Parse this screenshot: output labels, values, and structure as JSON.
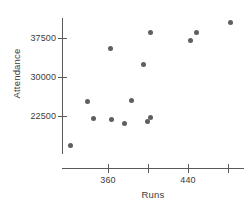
{
  "chart_data": {
    "type": "scatter",
    "title": "",
    "xlabel": "Runs",
    "ylabel": "Attendance",
    "xlim": [
      330,
      490
    ],
    "ylim": [
      16000,
      42000
    ],
    "grid": false,
    "legend": null,
    "x_ticks": [
      {
        "value": 360,
        "label": "360"
      },
      {
        "value": 400,
        "label": ""
      },
      {
        "value": 440,
        "label": "440"
      },
      {
        "value": 480,
        "label": ""
      }
    ],
    "y_ticks": [
      {
        "value": 37500,
        "label": "37500"
      },
      {
        "value": 30000,
        "label": "30000"
      },
      {
        "value": 22500,
        "label": "22500"
      }
    ],
    "point_color": "#5e5e63",
    "axis_color": "#5a5a5a",
    "points": [
      {
        "x": 338,
        "y": 17400
      },
      {
        "x": 385,
        "y": 24700
      },
      {
        "x": 391,
        "y": 22200
      },
      {
        "x": 398,
        "y": 35600
      },
      {
        "x": 408,
        "y": 21900
      },
      {
        "x": 422,
        "y": 21100
      },
      {
        "x": 445,
        "y": 24600
      },
      {
        "x": 459,
        "y": 21200
      },
      {
        "x": 462,
        "y": 21900
      },
      {
        "x": 463,
        "y": 38900
      },
      {
        "x": 455,
        "y": 32600
      },
      {
        "x": 502,
        "y": 36400
      },
      {
        "x": 508,
        "y": 38000
      },
      {
        "x": 542,
        "y": 39900
      }
    ],
    "points_px": [
      {
        "cx": 70,
        "cy": 145
      },
      {
        "cx": 87,
        "cy": 101
      },
      {
        "cx": 93,
        "cy": 118
      },
      {
        "cx": 110,
        "cy": 48
      },
      {
        "cx": 111,
        "cy": 119
      },
      {
        "cx": 124,
        "cy": 123
      },
      {
        "cx": 131,
        "cy": 100
      },
      {
        "cx": 147,
        "cy": 121
      },
      {
        "cx": 150,
        "cy": 117
      },
      {
        "cx": 150,
        "cy": 32
      },
      {
        "cx": 143,
        "cy": 64
      },
      {
        "cx": 190,
        "cy": 40
      },
      {
        "cx": 196,
        "cy": 32
      },
      {
        "cx": 230,
        "cy": 22
      }
    ],
    "tick_px": {
      "y": [
        {
          "label": "37500",
          "py": 38
        },
        {
          "label": "30000",
          "py": 77
        },
        {
          "label": "22500",
          "py": 116
        }
      ],
      "x": [
        {
          "label": "360",
          "px": 108
        },
        {
          "label": "",
          "px": 148
        },
        {
          "label": "440",
          "px": 188
        },
        {
          "label": "",
          "px": 228
        }
      ]
    }
  }
}
